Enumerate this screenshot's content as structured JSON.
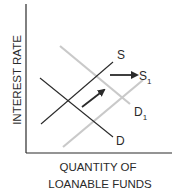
{
  "diagram": {
    "y_axis_label": "INTEREST RATE",
    "x_axis_label_line1": "QUANTITY OF",
    "x_axis_label_line2": "LOANABLE FUNDS",
    "curves": [
      {
        "id": "S",
        "label": "S",
        "subscript": "",
        "color": "#2a2a2a",
        "from": [
          41,
          124
        ],
        "to": [
          113,
          62
        ]
      },
      {
        "id": "D",
        "label": "D",
        "subscript": "",
        "color": "#2a2a2a",
        "from": [
          40,
          78
        ],
        "to": [
          113,
          137
        ]
      },
      {
        "id": "S1",
        "label": "S",
        "subscript": "1",
        "color": "#c9c9c9",
        "from": [
          63,
          147
        ],
        "to": [
          143,
          80
        ]
      },
      {
        "id": "D1",
        "label": "D",
        "subscript": "1",
        "color": "#c9c9c9",
        "from": [
          60,
          46
        ],
        "to": [
          130,
          104
        ]
      }
    ],
    "arrows": [
      {
        "id": "supply-shift",
        "from": [
          110,
          75
        ],
        "to": [
          137,
          75
        ]
      },
      {
        "id": "demand-shift",
        "from": [
          82,
          107
        ],
        "to": [
          104,
          90
        ]
      }
    ],
    "colors": {
      "axis": "#2a2a2a",
      "original_curve": "#2a2a2a",
      "shifted_curve": "#c9c9c9",
      "background": "#ffffff"
    }
  }
}
